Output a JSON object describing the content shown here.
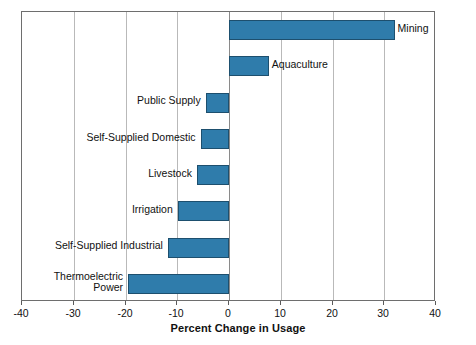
{
  "chart_data": {
    "type": "bar",
    "orientation": "horizontal",
    "title": "",
    "xlabel": "Percent Change in Usage",
    "ylabel": "",
    "xlim": [
      -40,
      40
    ],
    "xticks": [
      -40,
      -30,
      -20,
      -10,
      0,
      10,
      20,
      30,
      40
    ],
    "xticklabels": [
      "-40",
      "-30",
      "-20",
      "-10",
      "0",
      "10",
      "20",
      "30",
      "40"
    ],
    "grid": true,
    "grid_axis": "x",
    "legend": false,
    "bar_color": "#2f7cab",
    "bar_edge_color": "#1d4f6e",
    "categories": [
      "Mining",
      "Aquaculture",
      "Public Supply",
      "Self-Supplied Domestic",
      "Livestock",
      "Irrigation",
      "Self-Supplied Industrial",
      "Thermoelectric Power"
    ],
    "values": [
      32.0,
      7.7,
      -4.5,
      -5.5,
      -6.2,
      -9.9,
      -11.8,
      -19.5
    ],
    "label_side": [
      "right",
      "right",
      "left",
      "left",
      "left",
      "left",
      "left",
      "left"
    ]
  },
  "axis": {
    "title": "Percent Change in Usage",
    "ticks": [
      {
        "value": -40,
        "label": "-40"
      },
      {
        "value": -30,
        "label": "-30"
      },
      {
        "value": -20,
        "label": "-20"
      },
      {
        "value": -10,
        "label": "-10"
      },
      {
        "value": 0,
        "label": "0"
      },
      {
        "value": 10,
        "label": "10"
      },
      {
        "value": 20,
        "label": "20"
      },
      {
        "value": 30,
        "label": "30"
      },
      {
        "value": 40,
        "label": "40"
      }
    ]
  },
  "bars": [
    {
      "name": "Mining",
      "label": "Mining",
      "value": 32.0,
      "side": "right"
    },
    {
      "name": "Aquaculture",
      "label": "Aquaculture",
      "value": 7.7,
      "side": "right"
    },
    {
      "name": "Public Supply",
      "label": "Public Supply",
      "value": -4.5,
      "side": "left"
    },
    {
      "name": "Self-Supplied Domestic",
      "label": "Self-Supplied Domestic",
      "value": -5.5,
      "side": "left"
    },
    {
      "name": "Livestock",
      "label": "Livestock",
      "value": -6.2,
      "side": "left"
    },
    {
      "name": "Irrigation",
      "label": "Irrigation",
      "value": -9.9,
      "side": "left"
    },
    {
      "name": "Self-Supplied Industrial",
      "label": "Self-Supplied Industrial",
      "value": -11.8,
      "side": "left"
    },
    {
      "name": "Thermoelectric Power",
      "label": "Thermoelectric\nPower",
      "value": -19.5,
      "side": "left"
    }
  ]
}
